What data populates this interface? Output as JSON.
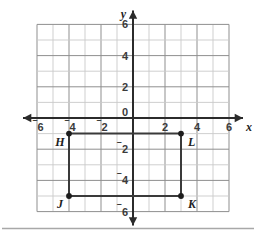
{
  "figure": {
    "axis_labels": {
      "x": "x",
      "y": "y"
    },
    "x_ticks": [
      {
        "value": -6,
        "text": "6",
        "negative": true
      },
      {
        "value": -4,
        "text": "4",
        "negative": true
      },
      {
        "value": -2,
        "text": "2",
        "negative": true
      },
      {
        "value": 2,
        "text": "2",
        "negative": false
      },
      {
        "value": 4,
        "text": "4",
        "negative": false
      },
      {
        "value": 6,
        "text": "6",
        "negative": false
      }
    ],
    "y_ticks": [
      {
        "value": 6,
        "text": "6",
        "negative": false
      },
      {
        "value": 4,
        "text": "4",
        "negative": false
      },
      {
        "value": 2,
        "text": "2",
        "negative": false
      },
      {
        "value": -2,
        "text": "2",
        "negative": true
      },
      {
        "value": -4,
        "text": "4",
        "negative": true
      },
      {
        "value": -6,
        "text": "6",
        "negative": true
      }
    ],
    "origin_label": "0",
    "colors": {
      "grid": "#c9c9c9",
      "grid_major": "#8f8f8f",
      "axis": "#2b2b2b",
      "shape_stroke": "#3a3a3a",
      "point_fill": "#1d1d1d",
      "separator": "#a8a8a8",
      "background": "#ffffff"
    }
  },
  "chart_data": {
    "type": "scatter",
    "title": "",
    "xlabel": "x",
    "ylabel": "y",
    "xlim": [
      -6,
      6
    ],
    "ylim": [
      -6,
      6
    ],
    "grid": true,
    "grid_step": 1,
    "tick_step": 2,
    "legend": "none",
    "points": [
      {
        "label": "H",
        "x": -4,
        "y": -1,
        "label_position": "below-left"
      },
      {
        "label": "L",
        "x": 3,
        "y": -1,
        "label_position": "below-right"
      },
      {
        "label": "J",
        "x": -4,
        "y": -5,
        "label_position": "below-left"
      },
      {
        "label": "K",
        "x": 3,
        "y": -5,
        "label_position": "below-right"
      }
    ],
    "shape": {
      "name": "rectangle-HLKJ",
      "vertices": [
        "H",
        "L",
        "K",
        "J"
      ],
      "closed": true,
      "width_units": 7,
      "height_units": 4
    }
  }
}
